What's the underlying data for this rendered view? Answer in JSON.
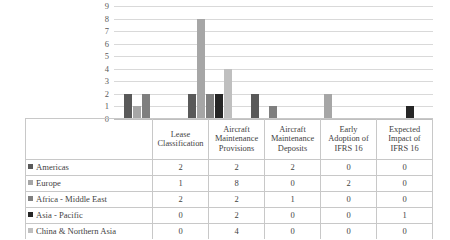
{
  "chart_data": {
    "type": "bar",
    "title": "",
    "xlabel": "",
    "ylabel": "",
    "ylim": [
      0,
      9
    ],
    "yticks": [
      9,
      8,
      7,
      6,
      5,
      4,
      3,
      2,
      1,
      0
    ],
    "grid": true,
    "legend_position": "table-left-column",
    "categories": [
      "Lease Classification",
      "Aircraft Maintenance Provisions",
      "Aircraft Maintenance Deposits",
      "Early Adoption of IFRS 16",
      "Expected Impact of IFRS 16"
    ],
    "category_lines": [
      [
        "Lease",
        "Classification"
      ],
      [
        "Aircraft",
        "Maintenance",
        "Provisions"
      ],
      [
        "Aircraft",
        "Maintenance",
        "Deposits"
      ],
      [
        "Early",
        "Adoption of",
        "IFRS 16"
      ],
      [
        "Expected",
        "Impact of",
        "IFRS 16"
      ]
    ],
    "series": [
      {
        "name": "Americas",
        "color": "#595959",
        "values": [
          2,
          2,
          2,
          0,
          0
        ]
      },
      {
        "name": "Europe",
        "color": "#a6a6a6",
        "values": [
          1,
          8,
          0,
          2,
          0
        ]
      },
      {
        "name": "Africa - Middle East",
        "color": "#7f7f7f",
        "values": [
          2,
          2,
          1,
          0,
          0
        ]
      },
      {
        "name": "Asia - Pacific",
        "color": "#262626",
        "values": [
          0,
          2,
          0,
          0,
          1
        ]
      },
      {
        "name": "China & Northern Asia",
        "color": "#bfbfbf",
        "values": [
          0,
          4,
          0,
          0,
          0
        ]
      }
    ]
  },
  "table": {
    "legend_header": "",
    "row_labels": [
      "Americas",
      "Europe",
      "Africa - Middle East",
      "Asia - Pacific",
      "China & Northern Asia"
    ],
    "rows": [
      [
        "2",
        "2",
        "2",
        "0",
        "0"
      ],
      [
        "1",
        "8",
        "0",
        "2",
        "0"
      ],
      [
        "2",
        "2",
        "1",
        "0",
        "0"
      ],
      [
        "0",
        "2",
        "0",
        "0",
        "1"
      ],
      [
        "0",
        "4",
        "0",
        "0",
        "0"
      ]
    ]
  }
}
